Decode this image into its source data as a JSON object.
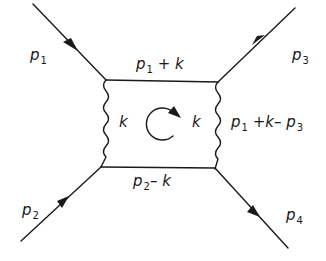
{
  "diagram": {
    "type": "feynman-box-diagram",
    "stroke_color": "#1a1a1a",
    "background": "#ffffff",
    "external_lines": [
      {
        "id": "p1",
        "label_main": "p",
        "label_sub": "1",
        "direction": "incoming"
      },
      {
        "id": "p2",
        "label_main": "p",
        "label_sub": "2",
        "direction": "incoming"
      },
      {
        "id": "p3",
        "label_main": "p",
        "label_sub": "3",
        "direction": "outgoing"
      },
      {
        "id": "p4",
        "label_main": "p",
        "label_sub": "4",
        "direction": "outgoing"
      }
    ],
    "internal_lines": {
      "top": {
        "type": "fermion",
        "parts": [
          "p",
          "1",
          " + k"
        ]
      },
      "bottom": {
        "type": "fermion",
        "parts": [
          "p",
          "2",
          "– k"
        ]
      },
      "left": {
        "type": "photon",
        "label": "k"
      },
      "right": {
        "type": "photon",
        "label_inner": "k",
        "parts": [
          "p",
          "1",
          " +k– ",
          "p",
          "3"
        ]
      }
    },
    "loop_momentum": {
      "label": "k",
      "orientation": "clockwise"
    }
  }
}
